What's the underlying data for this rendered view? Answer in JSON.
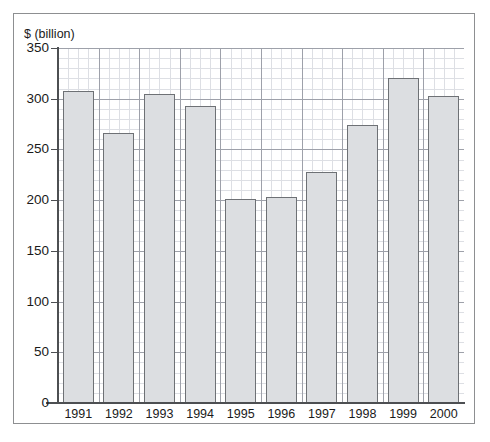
{
  "chart_data": {
    "type": "bar",
    "title": "$ (billion)",
    "xlabel": "",
    "ylabel": "$ (billion)",
    "categories": [
      "1991",
      "1992",
      "1993",
      "1994",
      "1995",
      "1996",
      "1997",
      "1998",
      "1999",
      "2000"
    ],
    "values": [
      308,
      266,
      305,
      293,
      201,
      203,
      228,
      274,
      320,
      303
    ],
    "ylim": [
      0,
      350
    ],
    "ytick_labels": [
      "0",
      "50",
      "100",
      "150",
      "200",
      "250",
      "300",
      "350"
    ],
    "ytick_values": [
      0,
      50,
      100,
      150,
      200,
      250,
      300,
      350
    ],
    "grid": "on",
    "grid_minor_step": 10,
    "grid_major_step": 50,
    "legend": "none",
    "colors": {
      "bar_fill": "#dcdee1",
      "bar_border": "#6e7175",
      "grid_minor": "#c9ccd4",
      "grid_major": "#9497a0",
      "axis": "#4d4f52",
      "frame": "#8d8f91",
      "text": "#1a1a1a",
      "background": "#ffffff"
    }
  }
}
